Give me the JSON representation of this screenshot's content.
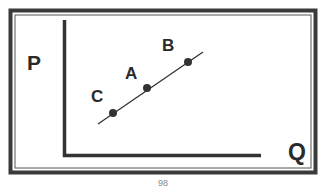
{
  "diagram": {
    "axes": {
      "y_label": "P",
      "x_label": "Q"
    },
    "points": [
      {
        "label": "C",
        "x": 113,
        "y": 113
      },
      {
        "label": "A",
        "x": 147,
        "y": 88
      },
      {
        "label": "B",
        "x": 188,
        "y": 62
      }
    ],
    "line_description": "Upward-sloping straight line through points C, A, B",
    "page_number": "98"
  },
  "colors": {
    "ink": "#2a2a2a",
    "background": "#ffffff"
  }
}
